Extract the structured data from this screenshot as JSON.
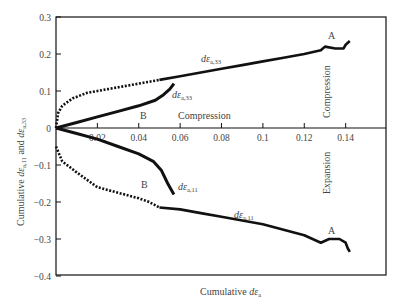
{
  "chart_data": {
    "type": "line",
    "title": "",
    "xlabel": "Cumulative dε_a",
    "ylabel": "Cumulative dε_a,11 and dε_a,33",
    "xlim": [
      0,
      0.16
    ],
    "ylim": [
      -0.4,
      0.3
    ],
    "grid": false,
    "legend": "none (inline curve labels)",
    "x_ticks": [
      0.02,
      0.04,
      0.06,
      0.08,
      0.1,
      0.12,
      0.14
    ],
    "x_tick_labels": [
      "0.02",
      "0.04",
      "0.06",
      "0.08",
      "0.1",
      "0.12",
      "0.14"
    ],
    "y_ticks": [
      0.3,
      0.2,
      0.1,
      0,
      -0.1,
      -0.2,
      -0.3,
      -0.4
    ],
    "y_tick_labels": [
      "0.3",
      "0.2",
      "0.1",
      "0",
      "-0.1",
      "-0.2",
      "-0.3",
      "-0.4"
    ],
    "series": [
      {
        "name": "A dε_a,33",
        "style": "dotted-to-solid",
        "x": [
          0,
          0.001,
          0.003,
          0.008,
          0.015,
          0.025,
          0.035,
          0.045,
          0.05,
          0.06,
          0.07,
          0.08,
          0.09,
          0.1,
          0.11,
          0.12,
          0.128,
          0.13,
          0.135,
          0.139,
          0.14,
          0.142
        ],
        "y": [
          0,
          0.04,
          0.06,
          0.08,
          0.095,
          0.105,
          0.115,
          0.125,
          0.13,
          0.14,
          0.15,
          0.16,
          0.17,
          0.18,
          0.19,
          0.2,
          0.21,
          0.22,
          0.215,
          0.215,
          0.225,
          0.235
        ]
      },
      {
        "name": "B dε_a,33",
        "style": "solid",
        "x": [
          0,
          0.01,
          0.02,
          0.03,
          0.04,
          0.048,
          0.052,
          0.055,
          0.057
        ],
        "y": [
          0,
          0.015,
          0.03,
          0.045,
          0.06,
          0.075,
          0.09,
          0.105,
          0.12
        ]
      },
      {
        "name": "B dε_a,11",
        "style": "solid",
        "x": [
          0,
          0.01,
          0.02,
          0.03,
          0.04,
          0.047,
          0.051,
          0.054,
          0.057
        ],
        "y": [
          0,
          -0.015,
          -0.03,
          -0.05,
          -0.07,
          -0.09,
          -0.115,
          -0.15,
          -0.18
        ]
      },
      {
        "name": "A dε_a,11",
        "style": "dotted-to-solid",
        "x": [
          0,
          0.003,
          0.01,
          0.02,
          0.03,
          0.04,
          0.045,
          0.05,
          0.06,
          0.07,
          0.08,
          0.09,
          0.1,
          0.11,
          0.12,
          0.128,
          0.132,
          0.137,
          0.14,
          0.141,
          0.142
        ],
        "y": [
          -0.05,
          -0.09,
          -0.12,
          -0.16,
          -0.175,
          -0.19,
          -0.2,
          -0.215,
          -0.22,
          -0.23,
          -0.24,
          -0.25,
          -0.26,
          -0.275,
          -0.29,
          -0.31,
          -0.3,
          -0.3,
          -0.31,
          -0.325,
          -0.335
        ]
      }
    ],
    "annotations": [
      {
        "text": "A",
        "x": 0.133,
        "y": 0.245
      },
      {
        "text": "A",
        "x": 0.133,
        "y": -0.285
      },
      {
        "text": "B",
        "x": 0.043,
        "y": 0.035
      },
      {
        "text": "B",
        "x": 0.043,
        "y": -0.15
      },
      {
        "text": "dε_a,33",
        "x": 0.07,
        "y": 0.2
      },
      {
        "text": "dε_a,33",
        "x": 0.06,
        "y": 0.1
      },
      {
        "text": "dε_a,11",
        "x": 0.06,
        "y": -0.175
      },
      {
        "text": "dε_a,11",
        "x": 0.085,
        "y": -0.255
      },
      {
        "text": "Compression",
        "x": 0.06,
        "y": 0.012
      },
      {
        "text": "Compression",
        "x": 0.13,
        "y": 0.02,
        "rotation": -90
      },
      {
        "text": "Expansion",
        "x": 0.13,
        "y": -0.03,
        "rotation": -90
      }
    ]
  },
  "labels": {
    "xlabel_main": "Cumulative ",
    "xlabel_var": "dε",
    "xlabel_sub": "a",
    "ylabel_main": "Cumulative ",
    "ylabel_var1": "dε",
    "ylabel_sub1": "a,11",
    "ylabel_and": " and ",
    "ylabel_var2": "dε",
    "ylabel_sub2": "a,33",
    "curve_var": "dε",
    "sub_33": "a,33",
    "sub_11": "a,11",
    "A": "A",
    "B": "B",
    "compression": "Compression",
    "expansion": "Expansion"
  }
}
